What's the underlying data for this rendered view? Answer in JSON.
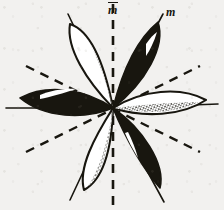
{
  "figure": {
    "background_color": "#f2f1ef",
    "ink_color": "#18160f",
    "petal_fill_light": "#ffffff",
    "stipple_color": "#18160f",
    "center": {
      "x": 113,
      "y": 108
    },
    "labels": [
      {
        "id": "m-vertical",
        "text": "m",
        "style": "italic-underlined",
        "x": 108,
        "y": 2
      },
      {
        "id": "m-diagonal",
        "text": "m",
        "style": "italic",
        "x": 166,
        "y": 6
      }
    ],
    "mirror_lines": [
      {
        "id": "mirror-vertical",
        "orientation": "vertical",
        "dashed": true,
        "x1": 113,
        "y1": 4,
        "x2": 113,
        "y2": 206
      },
      {
        "id": "mirror-diagonal-a",
        "orientation": "diagonal-up-right",
        "dashed": true,
        "x1": 26,
        "y1": 66,
        "x2": 200,
        "y2": 152
      },
      {
        "id": "mirror-diagonal-b",
        "orientation": "diagonal-down-right",
        "dashed": true,
        "x1": 26,
        "y1": 152,
        "x2": 200,
        "y2": 66
      }
    ],
    "petals": [
      {
        "id": "petal-upper-left",
        "angle_deg": -60,
        "fill": "white",
        "stippled": true,
        "highlight": false,
        "length": 96,
        "width": 30
      },
      {
        "id": "petal-upper-right",
        "angle_deg": -120,
        "fill": "black",
        "stippled": false,
        "highlight": true,
        "length": 96,
        "width": 30
      },
      {
        "id": "petal-left",
        "angle_deg": 0,
        "fill": "black",
        "stippled": false,
        "highlight": true,
        "length": 100,
        "width": 30
      },
      {
        "id": "petal-right",
        "angle_deg": 180,
        "fill": "white",
        "stippled": true,
        "highlight": false,
        "length": 100,
        "width": 30
      },
      {
        "id": "petal-lower-left",
        "angle_deg": 60,
        "fill": "white",
        "stippled": true,
        "highlight": false,
        "length": 92,
        "width": 28
      },
      {
        "id": "petal-lower-right",
        "angle_deg": 120,
        "fill": "black",
        "stippled": false,
        "highlight": true,
        "length": 92,
        "width": 28
      }
    ]
  }
}
